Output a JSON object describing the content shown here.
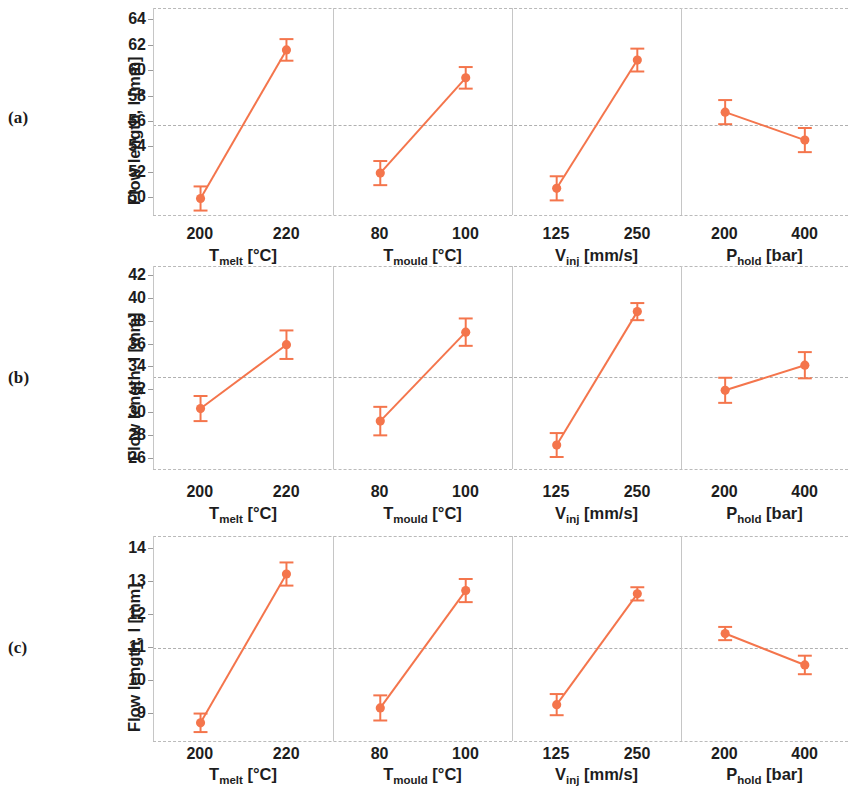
{
  "figure": {
    "rows": [
      {
        "tag": "(a)"
      },
      {
        "tag": "(b)"
      },
      {
        "tag": "(c)"
      }
    ],
    "ylabel": "Flow length, l [mm]",
    "factor_labels": [
      {
        "symbol": "T",
        "sub": "melt",
        "units": "[°C]"
      },
      {
        "symbol": "T",
        "sub": "mould",
        "units": "[°C]"
      },
      {
        "symbol": "V",
        "sub": "inj",
        "units": "[mm/s]"
      },
      {
        "symbol": "P",
        "sub": "hold",
        "units": "[bar]"
      }
    ],
    "marker_color": "#F4754C",
    "line_color": "#F4754C",
    "refline_color": "#b0b0b0"
  },
  "chart_data": [
    {
      "type": "line",
      "title": "(a)",
      "ylabel": "Flow length, l [mm]",
      "xlabel": "",
      "ylim": [
        48.6,
        64.9
      ],
      "yticks": [
        50,
        52,
        54,
        56,
        58,
        60,
        62,
        64
      ],
      "reference_line": 55.7,
      "grid": false,
      "panels": [
        {
          "factor": "Tmelt [°C]",
          "categories": [
            "200",
            "220"
          ],
          "values": [
            49.9,
            61.6
          ],
          "errors": [
            0.95,
            0.85
          ]
        },
        {
          "factor": "Tmould [°C]",
          "categories": [
            "80",
            "100"
          ],
          "values": [
            51.9,
            59.4
          ],
          "errors": [
            0.95,
            0.85
          ]
        },
        {
          "factor": "Vinj [mm/s]",
          "categories": [
            "125",
            "250"
          ],
          "values": [
            50.7,
            60.8
          ],
          "errors": [
            0.95,
            0.9
          ]
        },
        {
          "factor": "Phold [bar]",
          "categories": [
            "200",
            "400"
          ],
          "values": [
            56.7,
            54.5
          ],
          "errors": [
            0.95,
            0.95
          ]
        }
      ]
    },
    {
      "type": "line",
      "title": "(b)",
      "ylabel": "Flow length, l [mm]",
      "xlabel": "",
      "ylim": [
        25.0,
        42.8
      ],
      "yticks": [
        26,
        28,
        30,
        32,
        34,
        36,
        38,
        40,
        42
      ],
      "reference_line": 33.1,
      "grid": false,
      "panels": [
        {
          "factor": "Tmelt [°C]",
          "categories": [
            "200",
            "220"
          ],
          "values": [
            30.3,
            35.9
          ],
          "errors": [
            1.1,
            1.25
          ]
        },
        {
          "factor": "Tmould [°C]",
          "categories": [
            "80",
            "100"
          ],
          "values": [
            29.2,
            37.0
          ],
          "errors": [
            1.25,
            1.2
          ]
        },
        {
          "factor": "Vinj [mm/s]",
          "categories": [
            "125",
            "250"
          ],
          "values": [
            27.1,
            38.8
          ],
          "errors": [
            1.05,
            0.75
          ]
        },
        {
          "factor": "Phold [bar]",
          "categories": [
            "200",
            "400"
          ],
          "values": [
            31.9,
            34.1
          ],
          "errors": [
            1.1,
            1.15
          ]
        }
      ]
    },
    {
      "type": "line",
      "title": "(c)",
      "ylabel": "Flow length, l [mm]",
      "xlabel": "",
      "ylim": [
        8.15,
        14.35
      ],
      "yticks": [
        9,
        10,
        11,
        12,
        13,
        14
      ],
      "reference_line": 10.95,
      "grid": false,
      "panels": [
        {
          "factor": "Tmelt [°C]",
          "categories": [
            "200",
            "220"
          ],
          "values": [
            8.7,
            13.2
          ],
          "errors": [
            0.28,
            0.35
          ]
        },
        {
          "factor": "Tmould [°C]",
          "categories": [
            "80",
            "100"
          ],
          "values": [
            9.15,
            12.7
          ],
          "errors": [
            0.38,
            0.35
          ]
        },
        {
          "factor": "Vinj [mm/s]",
          "categories": [
            "125",
            "250"
          ],
          "values": [
            9.25,
            12.6
          ],
          "errors": [
            0.32,
            0.2
          ]
        },
        {
          "factor": "Phold [bar]",
          "categories": [
            "200",
            "400"
          ],
          "values": [
            11.4,
            10.45
          ],
          "errors": [
            0.2,
            0.28
          ]
        }
      ]
    }
  ]
}
